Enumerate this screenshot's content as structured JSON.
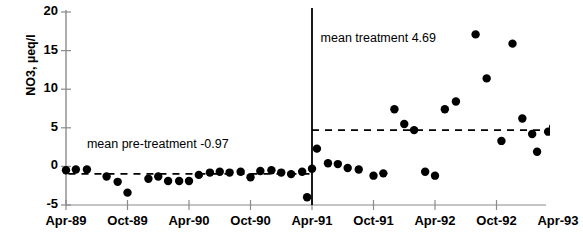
{
  "chart_data": {
    "type": "scatter",
    "title": "",
    "xlabel": "",
    "ylabel": "NO3, µeq/l",
    "ylim": [
      -5,
      20
    ],
    "yticks": [
      20,
      15,
      10,
      5,
      0,
      -5
    ],
    "xticks": [
      "Apr-89",
      "Oct-89",
      "Apr-90",
      "Oct-90",
      "Apr-91",
      "Oct-91",
      "Apr-92",
      "Oct-92",
      "Apr-93"
    ],
    "xlim_labels": [
      "Apr-89",
      "Apr-93"
    ],
    "grid": false,
    "legend": "none",
    "series": [
      {
        "name": "NO3 concentration",
        "marker": "filled-circle",
        "color": "#000000",
        "points": [
          {
            "x": "Apr-89",
            "t": 0.0,
            "y": -0.5
          },
          {
            "x": "May-89",
            "t": 0.08,
            "y": -0.4
          },
          {
            "x": "Jun-89",
            "t": 0.17,
            "y": -0.4
          },
          {
            "x": "Aug-89",
            "t": 0.33,
            "y": -1.3
          },
          {
            "x": "Sep-89",
            "t": 0.42,
            "y": -2.0
          },
          {
            "x": "Oct-89",
            "t": 0.5,
            "y": -3.4
          },
          {
            "x": "Dec-89",
            "t": 0.67,
            "y": -1.6
          },
          {
            "x": "Jan-90",
            "t": 0.75,
            "y": -1.3
          },
          {
            "x": "Feb-90",
            "t": 0.83,
            "y": -1.9
          },
          {
            "x": "Mar-90",
            "t": 0.92,
            "y": -1.9
          },
          {
            "x": "Apr-90",
            "t": 1.0,
            "y": -1.9
          },
          {
            "x": "May-90",
            "t": 1.08,
            "y": -1.1
          },
          {
            "x": "Jun-90",
            "t": 1.17,
            "y": -0.8
          },
          {
            "x": "Jul-90",
            "t": 1.25,
            "y": -0.7
          },
          {
            "x": "Aug-90",
            "t": 1.33,
            "y": -0.8
          },
          {
            "x": "Sep-90",
            "t": 1.42,
            "y": -0.7
          },
          {
            "x": "Oct-90",
            "t": 1.5,
            "y": -1.4
          },
          {
            "x": "Nov-90",
            "t": 1.58,
            "y": -0.6
          },
          {
            "x": "Dec-90",
            "t": 1.67,
            "y": -0.5
          },
          {
            "x": "Jan-91",
            "t": 1.75,
            "y": -0.8
          },
          {
            "x": "Feb-91",
            "t": 1.83,
            "y": -1.0
          },
          {
            "x": "Mar-91",
            "t": 1.92,
            "y": -0.7
          },
          {
            "x": "Mar-91b",
            "t": 1.96,
            "y": -4.0
          },
          {
            "x": "Apr-91",
            "t": 2.0,
            "y": -0.3
          },
          {
            "x": "May-91",
            "t": 2.04,
            "y": 2.3
          },
          {
            "x": "Jun-91",
            "t": 2.13,
            "y": 0.4
          },
          {
            "x": "Jul-91",
            "t": 2.21,
            "y": 0.3
          },
          {
            "x": "Aug-91",
            "t": 2.29,
            "y": -0.2
          },
          {
            "x": "Sep-91",
            "t": 2.38,
            "y": -0.4
          },
          {
            "x": "Oct-91",
            "t": 2.5,
            "y": -1.2
          },
          {
            "x": "Nov-91",
            "t": 2.58,
            "y": -0.9
          },
          {
            "x": "Dec-91",
            "t": 2.67,
            "y": 7.4
          },
          {
            "x": "Jan-92",
            "t": 2.75,
            "y": 5.5
          },
          {
            "x": "Feb-92",
            "t": 2.83,
            "y": 4.7
          },
          {
            "x": "Mar-92",
            "t": 2.92,
            "y": -0.7
          },
          {
            "x": "Apr-92",
            "t": 3.0,
            "y": -1.2
          },
          {
            "x": "May-92",
            "t": 3.08,
            "y": 7.4
          },
          {
            "x": "Jun-92",
            "t": 3.17,
            "y": 8.4
          },
          {
            "x": "Jul-92",
            "t": 3.33,
            "y": 17.1
          },
          {
            "x": "Aug-92",
            "t": 3.42,
            "y": 11.4
          },
          {
            "x": "Sep-92",
            "t": 3.54,
            "y": 3.3
          },
          {
            "x": "Oct-92",
            "t": 3.63,
            "y": 15.9
          },
          {
            "x": "Nov-92",
            "t": 3.71,
            "y": 6.2
          },
          {
            "x": "Dec-92",
            "t": 3.79,
            "y": 4.2
          },
          {
            "x": "Jan-93",
            "t": 3.83,
            "y": 1.9
          },
          {
            "x": "Feb-93",
            "t": 3.92,
            "y": 4.5
          },
          {
            "x": "Mar-93",
            "t": 3.96,
            "y": 5.1
          },
          {
            "x": "Apr-93",
            "t": 4.0,
            "y": 5.0
          }
        ]
      }
    ],
    "reference_lines": [
      {
        "name": "pre-treatment-mean",
        "label": "mean pre-treatment  -0.97",
        "value": -0.97,
        "style": "dashed",
        "from_t": 0.02,
        "to_t": 2.0
      },
      {
        "name": "treatment-mean",
        "label": "mean treatment  4.69",
        "value": 4.69,
        "style": "dashed",
        "from_t": 2.0,
        "to_t": 4.02
      }
    ],
    "vertical_divider": {
      "name": "treatment-start-divider",
      "at_label": "Apr-91",
      "at_t": 2.0,
      "style": "solid"
    },
    "annotations": [
      {
        "name": "pre-treatment-annotation",
        "text": "mean pre-treatment  -0.97",
        "t": 0.17,
        "y": 2.6
      },
      {
        "name": "treatment-annotation",
        "text": "mean treatment  4.69",
        "t": 2.07,
        "y": 16.4
      }
    ]
  }
}
